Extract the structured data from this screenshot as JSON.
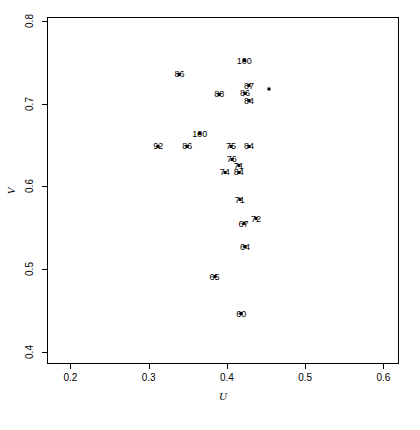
{
  "chart_data": {
    "type": "scatter",
    "title": "",
    "xlabel": "U",
    "ylabel": "V",
    "xlim": [
      0.17,
      0.62
    ],
    "ylim": [
      0.385,
      0.805
    ],
    "xticks": [
      "0.2",
      "0.3",
      "0.4",
      "0.5",
      "0.6"
    ],
    "xtickvalues": [
      0.2,
      0.3,
      0.4,
      0.5,
      0.6
    ],
    "yticks": [
      "0.4",
      "0.5",
      "0.6",
      "0.7",
      "0.8"
    ],
    "ytickvalues": [
      0.4,
      0.5,
      0.6,
      0.7,
      0.8
    ],
    "grid": false,
    "legend": null,
    "marker": "filled-square",
    "point_labels": true,
    "points": [
      {
        "label": "100",
        "x": 0.421,
        "y": 0.753
      },
      {
        "label": "86",
        "x": 0.338,
        "y": 0.737
      },
      {
        "label": "87",
        "x": 0.427,
        "y": 0.723
      },
      {
        "label": "88",
        "x": 0.389,
        "y": 0.713
      },
      {
        "label": "86",
        "x": 0.422,
        "y": 0.714
      },
      {
        "label": "84",
        "x": 0.427,
        "y": 0.705
      },
      {
        "label": "",
        "x": 0.452,
        "y": 0.719
      },
      {
        "label": "100",
        "x": 0.364,
        "y": 0.665
      },
      {
        "label": "92",
        "x": 0.311,
        "y": 0.65
      },
      {
        "label": "86",
        "x": 0.348,
        "y": 0.65
      },
      {
        "label": "75",
        "x": 0.404,
        "y": 0.65
      },
      {
        "label": "84",
        "x": 0.427,
        "y": 0.65
      },
      {
        "label": "76",
        "x": 0.405,
        "y": 0.634
      },
      {
        "label": "71",
        "x": 0.414,
        "y": 0.626
      },
      {
        "label": "74",
        "x": 0.396,
        "y": 0.618
      },
      {
        "label": "84",
        "x": 0.414,
        "y": 0.618
      },
      {
        "label": "71",
        "x": 0.415,
        "y": 0.585
      },
      {
        "label": "72",
        "x": 0.436,
        "y": 0.562
      },
      {
        "label": "67",
        "x": 0.42,
        "y": 0.556
      },
      {
        "label": "64",
        "x": 0.422,
        "y": 0.528
      },
      {
        "label": "65",
        "x": 0.383,
        "y": 0.492
      },
      {
        "label": "60",
        "x": 0.417,
        "y": 0.447
      }
    ]
  },
  "layout": {
    "plot_left": 47,
    "plot_top": 17,
    "plot_width": 352,
    "plot_height": 347
  }
}
